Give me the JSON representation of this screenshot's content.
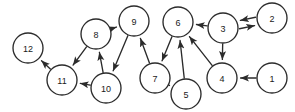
{
  "figure": {
    "background_color": "#ffffff",
    "width": 295,
    "height": 112
  },
  "style": {
    "node_stroke_color": "#2b2b2b",
    "node_fill_color": "#ffffff",
    "edge_color": "#2b2b2b",
    "label_color": "#1a1a1a",
    "node_radius": 15,
    "stroke_width": 1.35
  },
  "chart_data": {
    "type": "diagram",
    "subtype": "directed-graph",
    "directed": true,
    "node_count": 12,
    "edge_count": 16,
    "nodes": [
      {
        "id": "1",
        "label": "1",
        "x": 272,
        "y": 78,
        "r": 15
      },
      {
        "id": "2",
        "label": "2",
        "x": 272,
        "y": 18,
        "r": 15
      },
      {
        "id": "3",
        "label": "3",
        "x": 223,
        "y": 28,
        "r": 15
      },
      {
        "id": "4",
        "label": "4",
        "x": 222,
        "y": 78,
        "r": 15
      },
      {
        "id": "5",
        "label": "5",
        "x": 186,
        "y": 94,
        "r": 15
      },
      {
        "id": "6",
        "label": "6",
        "x": 178,
        "y": 22,
        "r": 15
      },
      {
        "id": "7",
        "label": "7",
        "x": 155,
        "y": 78,
        "r": 15
      },
      {
        "id": "8",
        "label": "8",
        "x": 96,
        "y": 34,
        "r": 15
      },
      {
        "id": "9",
        "label": "9",
        "x": 134,
        "y": 21,
        "r": 15
      },
      {
        "id": "10",
        "label": "10",
        "x": 106,
        "y": 88,
        "r": 15
      },
      {
        "id": "11",
        "label": "11",
        "x": 62,
        "y": 80,
        "r": 15
      },
      {
        "id": "12",
        "label": "12",
        "x": 28,
        "y": 48,
        "r": 15
      }
    ],
    "edges": [
      {
        "from": "1",
        "to": "4",
        "offset": 0
      },
      {
        "from": "3",
        "to": "2",
        "offset": 4
      },
      {
        "from": "2",
        "to": "3",
        "offset": 4
      },
      {
        "from": "3",
        "to": "4",
        "offset": 0
      },
      {
        "from": "3",
        "to": "6",
        "offset": 0
      },
      {
        "from": "4",
        "to": "6",
        "offset": 0
      },
      {
        "from": "5",
        "to": "6",
        "offset": 0
      },
      {
        "from": "6",
        "to": "7",
        "offset": 0
      },
      {
        "from": "7",
        "to": "5",
        "offset": 0
      },
      {
        "from": "7",
        "to": "9",
        "offset": 0
      },
      {
        "from": "8",
        "to": "9",
        "offset": 0
      },
      {
        "from": "8",
        "to": "11",
        "offset": 0
      },
      {
        "from": "9",
        "to": "10",
        "offset": 0
      },
      {
        "from": "10",
        "to": "8",
        "offset": 0
      },
      {
        "from": "10",
        "to": "11",
        "offset": 0
      },
      {
        "from": "11",
        "to": "12",
        "offset": 0
      }
    ],
    "adjacency_list": {
      "1": [
        "4"
      ],
      "2": [
        "3"
      ],
      "3": [
        "2",
        "4",
        "6"
      ],
      "4": [
        "6"
      ],
      "5": [
        "6"
      ],
      "6": [
        "7"
      ],
      "7": [
        "5",
        "9"
      ],
      "8": [
        "9",
        "11"
      ],
      "9": [
        "10"
      ],
      "10": [
        "8",
        "11"
      ],
      "11": [
        "12"
      ],
      "12": []
    }
  }
}
